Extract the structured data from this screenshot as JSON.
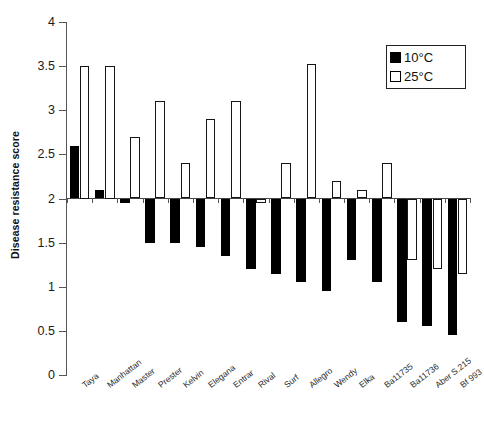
{
  "chart_data": {
    "type": "bar",
    "title": "",
    "xlabel": "",
    "ylabel": "Disease resistance score",
    "ylim": [
      0,
      4
    ],
    "yticks": [
      "0",
      "0.5",
      "1",
      "1.5",
      "2",
      "2.5",
      "3",
      "3.5",
      "4"
    ],
    "grid": false,
    "legend_position": "top-right",
    "baseline": 2,
    "categories": [
      "Taya",
      "Manhattan",
      "Master",
      "Prester",
      "Kelvin",
      "Elegana",
      "Entrar",
      "Rival",
      "Surf",
      "Allegro",
      "Wendy",
      "Elka",
      "Ba11735",
      "Ba11736",
      "Aber S.215",
      "Bf 993"
    ],
    "series": [
      {
        "name": "10°C",
        "color": "#000000",
        "fill": "solid",
        "values": [
          2.6,
          2.1,
          1.95,
          1.5,
          1.5,
          1.45,
          1.35,
          1.2,
          1.15,
          1.05,
          0.95,
          1.3,
          1.05,
          0.6,
          0.55,
          0.45
        ]
      },
      {
        "name": "25°C",
        "color": "#ffffff",
        "fill": "open",
        "values": [
          3.5,
          3.5,
          2.7,
          3.1,
          2.4,
          2.9,
          3.1,
          1.95,
          2.4,
          3.52,
          2.2,
          2.1,
          2.4,
          1.3,
          1.2,
          1.15
        ]
      }
    ]
  },
  "legend": {
    "items": [
      {
        "label": "10°C",
        "swatch": "cold"
      },
      {
        "label": "25°C",
        "swatch": "warm"
      }
    ]
  },
  "axes": {
    "y_title": "Disease resistance score"
  }
}
